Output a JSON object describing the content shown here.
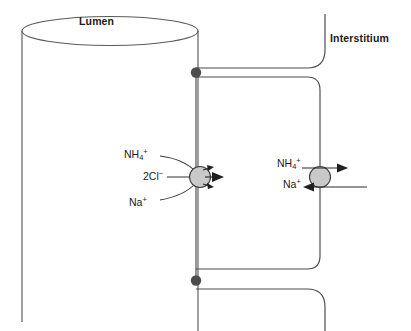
{
  "diagram": {
    "compartments": {
      "lumen_label": "Lumen",
      "interstitium_label": "Interstitium"
    },
    "apical_transporter": {
      "name": "Na-K-2Cl cotransporter (NKCC2) carrying NH4+",
      "direction": "lumen-to-cell",
      "substrates": [
        {
          "id": "nh4",
          "label_text": "NH",
          "sub": "4",
          "sup": "+"
        },
        {
          "id": "2cl",
          "label_text": "2Cl",
          "sub": "",
          "sup": "−"
        },
        {
          "id": "na",
          "label_text": "Na",
          "sub": "",
          "sup": "+"
        }
      ]
    },
    "basolateral_transporter": {
      "name": "Na+/NH4+ exchanger",
      "substrates": [
        {
          "id": "nh4-out",
          "label_text": "NH",
          "sub": "4",
          "sup": "+",
          "direction": "cell-to-interstitium"
        },
        {
          "id": "na-in",
          "label_text": "Na",
          "sub": "",
          "sup": "+",
          "direction": "interstitium-to-cell"
        }
      ]
    },
    "tight_junctions": [
      {
        "id": "tj-apical-top",
        "x": 196,
        "y": 72
      },
      {
        "id": "tj-apical-bottom",
        "x": 196,
        "y": 280
      }
    ],
    "colors": {
      "transporter_fill": "#c9c9c9",
      "transporter_stroke": "#3d3d3d",
      "membrane_stroke": "#4a4a4a",
      "junction_dot": "#4d4d4d",
      "arrow": "#1f1f1f",
      "text": "#1a1a1a",
      "background": "#ffffff"
    }
  }
}
